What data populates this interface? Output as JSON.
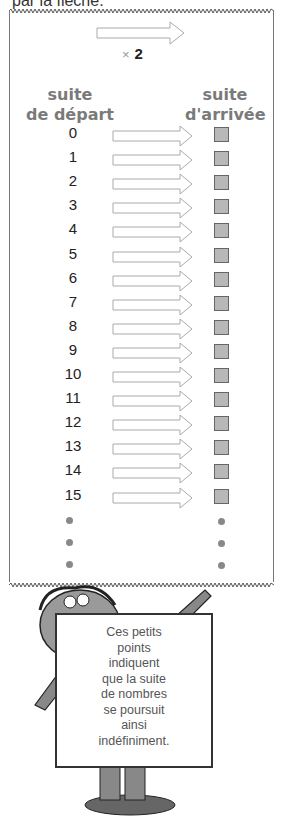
{
  "header": {
    "text": "par la flèche."
  },
  "operator": {
    "symbol": "×",
    "value": "2"
  },
  "columns": {
    "left": {
      "line1": "suite",
      "line2": "de départ"
    },
    "right": {
      "line1": "suite",
      "line2": "d'arrivée"
    }
  },
  "rows": [
    "0",
    "1",
    "2",
    "3",
    "4",
    "5",
    "6",
    "7",
    "8",
    "9",
    "10",
    "11",
    "12",
    "13",
    "14",
    "15"
  ],
  "ellipsis_dots": 3,
  "sign": {
    "lines": [
      "Ces petits",
      "points",
      "indiquent",
      "que la suite",
      "de nombres",
      "se poursuit",
      "ainsi",
      "indéfiniment."
    ]
  },
  "colors": {
    "box_fill": "#b8b8b8",
    "heading": "#7a7a7a",
    "dot": "#888888"
  }
}
